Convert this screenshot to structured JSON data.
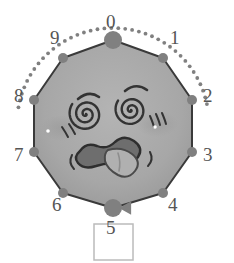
{
  "figure": {
    "background_color": "#ffffff"
  },
  "polygon": {
    "name": "decagon",
    "sides": 10,
    "fill_color": "#a8a8a8",
    "stroke_color": "#3a3a3a",
    "stroke_width": 2,
    "center_x": 113,
    "center_y": 124,
    "radius": 85
  },
  "vertices": [
    {
      "id": "0",
      "label": "0",
      "x": 113,
      "y": 40,
      "marker_radius": 9,
      "label_x": 106,
      "label_y": 12
    },
    {
      "id": "1",
      "label": "1",
      "x": 163,
      "y": 58,
      "marker_radius": 5,
      "label_x": 170,
      "label_y": 28
    },
    {
      "id": "2",
      "label": "2",
      "x": 192,
      "y": 100,
      "marker_radius": 5,
      "label_x": 203,
      "label_y": 86
    },
    {
      "id": "3",
      "label": "3",
      "x": 192,
      "y": 152,
      "marker_radius": 5,
      "label_x": 203,
      "label_y": 145
    },
    {
      "id": "4",
      "label": "4",
      "x": 163,
      "y": 193,
      "marker_radius": 5,
      "label_x": 168,
      "label_y": 195
    },
    {
      "id": "5",
      "label": "5",
      "x": 113,
      "y": 208,
      "marker_radius": 9,
      "label_x": 106,
      "label_y": 218
    },
    {
      "id": "6",
      "label": "6",
      "x": 63,
      "y": 193,
      "marker_radius": 5,
      "label_x": 52,
      "label_y": 195
    },
    {
      "id": "7",
      "label": "7",
      "x": 34,
      "y": 152,
      "marker_radius": 5,
      "label_x": 14,
      "label_y": 145
    },
    {
      "id": "8",
      "label": "8",
      "x": 34,
      "y": 100,
      "marker_radius": 5,
      "label_x": 14,
      "label_y": 86
    },
    {
      "id": "9",
      "label": "9",
      "x": 63,
      "y": 58,
      "marker_radius": 5,
      "label_x": 50,
      "label_y": 28
    }
  ],
  "vertex_marker_color": "#808080",
  "arc": {
    "name": "dotted-arrow-arc",
    "style": "dotted",
    "color": "#808080",
    "dot_radius": 1.9,
    "dot_spacing": 7,
    "start_angle_deg": -80,
    "end_angle_deg": 78,
    "radius": 96,
    "center_x": 113,
    "center_y": 124,
    "arrowhead": {
      "x": 128,
      "y": 208,
      "direction": "left",
      "size": 9,
      "color": "#808080"
    }
  },
  "face": {
    "name": "dizzy-face",
    "ink_color": "#333333",
    "blush_color": "#9a9a9a",
    "mouth_fill": "#6e6e6e",
    "mouth_stroke": "#2e2e2e",
    "tongue_fill": "#b0b0b0",
    "tongue_stroke": "#4a4a4a",
    "highlight_color": "#ffffff",
    "left_eye": {
      "cx": 86,
      "cy": 114,
      "r": 17,
      "type": "spiral"
    },
    "right_eye": {
      "cx": 131,
      "cy": 110,
      "r": 16,
      "type": "spiral"
    },
    "left_eyebrow": {
      "cx": 89,
      "cy": 96,
      "type": "arc"
    },
    "right_eyebrow": {
      "cx": 136,
      "cy": 88,
      "type": "arc"
    },
    "mouth": {
      "cx": 110,
      "cy": 156,
      "type": "wavy-open-with-tongue"
    }
  },
  "box": {
    "name": "empty-box",
    "x": 94,
    "y": 224,
    "width": 39,
    "height": 36,
    "fill": "#ffffff",
    "stroke": "#bbbbbb",
    "stroke_width": 1.5
  }
}
